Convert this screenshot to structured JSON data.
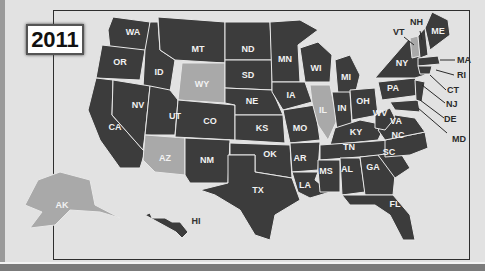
{
  "title": {
    "year": "2011"
  },
  "colors": {
    "state_default": "#3c3c3c",
    "state_highlight": "#a9a9a9",
    "border": "#e8e8e8",
    "background": "#e2e2e2",
    "frame": "#2e2e2e"
  },
  "highlighted_states": [
    "WY",
    "AZ",
    "IL",
    "AK",
    "VT"
  ],
  "states": {
    "WA": "WA",
    "OR": "OR",
    "CA": "CA",
    "ID": "ID",
    "NV": "NV",
    "MT": "MT",
    "WY": "WY",
    "UT": "UT",
    "AZ": "AZ",
    "CO": "CO",
    "NM": "NM",
    "ND": "ND",
    "SD": "SD",
    "NE": "NE",
    "KS": "KS",
    "OK": "OK",
    "TX": "TX",
    "MN": "MN",
    "IA": "IA",
    "MO": "MO",
    "AR": "AR",
    "LA": "LA",
    "WI": "WI",
    "IL": "IL",
    "MI": "MI",
    "IN": "IN",
    "OH": "OH",
    "KY": "KY",
    "TN": "TN",
    "MS": "MS",
    "AL": "AL",
    "GA": "GA",
    "FL": "FL",
    "SC": "SC",
    "NC": "NC",
    "VA": "VA",
    "WV": "WV",
    "PA": "PA",
    "NY": "NY",
    "ME": "ME",
    "AK": "AK",
    "HI": "HI"
  },
  "callouts": {
    "VT": "VT",
    "NH": "NH",
    "MA": "MA",
    "RI": "RI",
    "CT": "CT",
    "NJ": "NJ",
    "DE": "DE",
    "MD": "MD"
  }
}
